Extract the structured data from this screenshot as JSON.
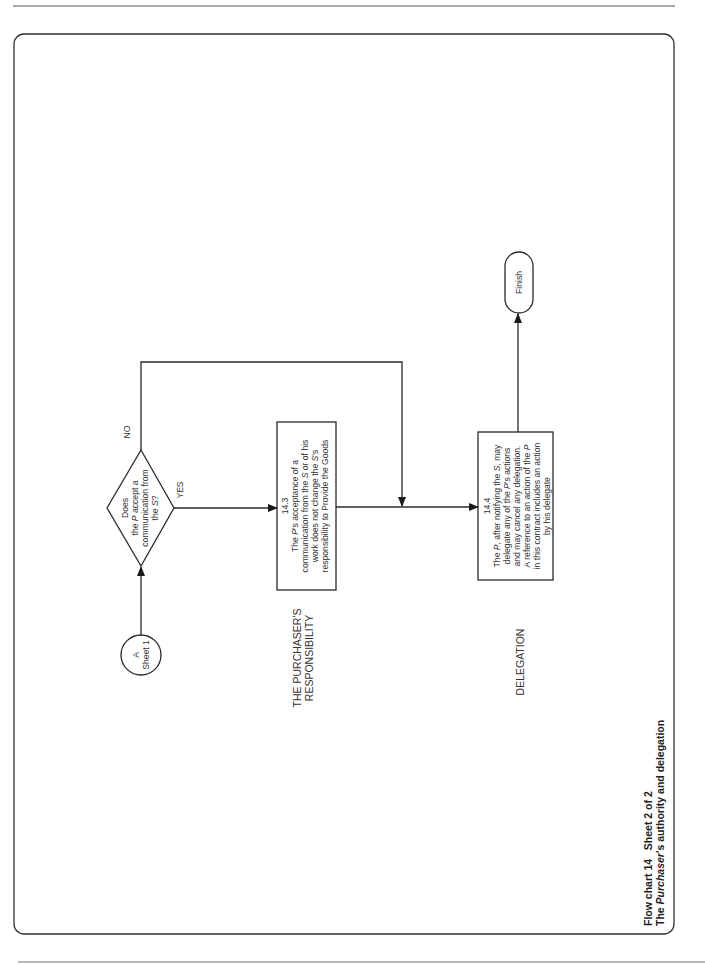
{
  "page": {
    "caption": {
      "line1": "Flow chart 14   Sheet 2 of 2",
      "line2_prefix": "The ",
      "line2_italic": "Purchaser",
      "line2_suffix": "'s authority and delegation"
    }
  },
  "flowchart": {
    "connector": {
      "line1": "A",
      "line2": "Sheet 1"
    },
    "decision": {
      "line1": "Does",
      "line2_pre": "the ",
      "line2_it": "P",
      "line2_post": " accept a",
      "line3": "communication from",
      "line4_pre": "the ",
      "line4_it": "S",
      "line4_post": "?",
      "yes_label": "YES",
      "no_label": "NO"
    },
    "section_labels": {
      "responsibility_line1": "THE PURCHASER'S",
      "responsibility_line2": "RESPONSIBILITY",
      "delegation": "DELEGATION"
    },
    "box_14_3": {
      "clause": "14.3",
      "lines": [
        [
          "The ",
          "P",
          "'s acceptance of a"
        ],
        [
          "communication from the ",
          "S",
          " or of his"
        ],
        [
          "work does not change the ",
          "S",
          "'s"
        ],
        [
          "responsibility to Provide the Goods",
          "",
          ""
        ]
      ]
    },
    "box_14_4": {
      "clause": "14.4",
      "lines": [
        [
          "The ",
          "P",
          ", after notifying the ",
          "S",
          ", may"
        ],
        [
          "delegate any of the ",
          "P",
          "'s actions",
          "",
          ""
        ],
        [
          "and may cancel any delegation.",
          "",
          "",
          "",
          ""
        ],
        [
          "A reference to an action of the ",
          "P",
          "",
          "",
          ""
        ],
        [
          "in this contract includes an action",
          "",
          "",
          "",
          ""
        ],
        [
          "by his delegate",
          "",
          "",
          "",
          ""
        ]
      ]
    },
    "terminal": {
      "label": "Finish"
    }
  }
}
